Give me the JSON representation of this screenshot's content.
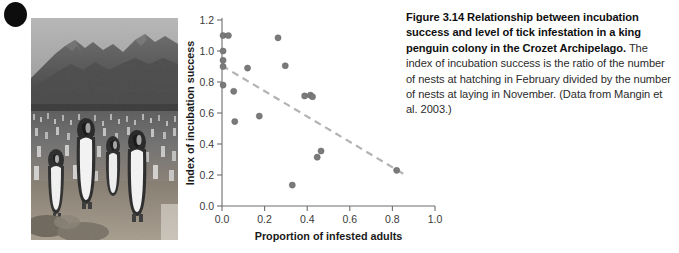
{
  "figure": {
    "bullet_icon": "black-dot-icon",
    "photo_alt": "king-penguin-colony-photo"
  },
  "caption": {
    "lead": "Figure 3.14 Relationship between incubation success and level of tick infestation in a king penguin colony in the Crozet Archipelago.",
    "body": " The index of incubation success is the ratio of the number of nests at hatching in February divided by the number of nests at laying in November. (Data from Mangin et al. 2003.)"
  },
  "chart_data": {
    "type": "scatter",
    "title": "",
    "xlabel": "Proportion of infested adults",
    "ylabel": "Index of incubation success",
    "xlim": [
      0.0,
      1.0
    ],
    "ylim": [
      0.0,
      1.2
    ],
    "xticks": [
      "0.0",
      "0.2",
      "0.4",
      "0.6",
      "0.8",
      "1.0"
    ],
    "xtick_values": [
      0.0,
      0.2,
      0.4,
      0.6,
      0.8,
      1.0
    ],
    "yticks": [
      "0.0",
      "0.2",
      "0.4",
      "0.6",
      "0.8",
      "1.0",
      "1.2"
    ],
    "ytick_values": [
      0.0,
      0.2,
      0.4,
      0.6,
      0.8,
      1.0,
      1.2
    ],
    "grid": false,
    "legend": null,
    "marker_color": "#7a7a7a",
    "trendline_color": "#b3b3b3",
    "trendline_style": "dashed",
    "points": [
      {
        "x": 0.005,
        "y": 1.1
      },
      {
        "x": 0.03,
        "y": 1.1
      },
      {
        "x": 0.005,
        "y": 1.0
      },
      {
        "x": 0.005,
        "y": 0.94
      },
      {
        "x": 0.005,
        "y": 0.9
      },
      {
        "x": 0.005,
        "y": 0.78
      },
      {
        "x": 0.055,
        "y": 0.74
      },
      {
        "x": 0.06,
        "y": 0.545
      },
      {
        "x": 0.12,
        "y": 0.89
      },
      {
        "x": 0.175,
        "y": 0.58
      },
      {
        "x": 0.263,
        "y": 1.085
      },
      {
        "x": 0.297,
        "y": 0.905
      },
      {
        "x": 0.33,
        "y": 0.135
      },
      {
        "x": 0.388,
        "y": 0.71
      },
      {
        "x": 0.415,
        "y": 0.715
      },
      {
        "x": 0.425,
        "y": 0.705
      },
      {
        "x": 0.447,
        "y": 0.315
      },
      {
        "x": 0.465,
        "y": 0.355
      },
      {
        "x": 0.82,
        "y": 0.23
      }
    ],
    "trendline": {
      "x0": 0.0,
      "y0": 0.905,
      "x1": 0.855,
      "y1": 0.205
    }
  }
}
